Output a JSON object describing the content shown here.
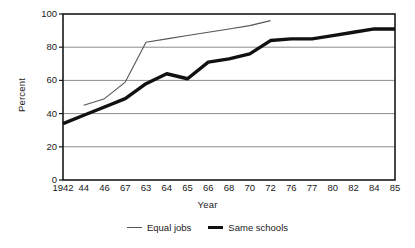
{
  "chart_data": {
    "type": "line",
    "title": "",
    "xlabel": "Year",
    "ylabel": "Percent",
    "ylim": [
      0,
      100
    ],
    "yticks": [
      0,
      20,
      40,
      60,
      80,
      100
    ],
    "grid": "horizontal",
    "legend_position": "bottom",
    "categories": [
      "1942",
      "44",
      "46",
      "67",
      "63",
      "64",
      "65",
      "66",
      "68",
      "70",
      "72",
      "76",
      "77",
      "80",
      "82",
      "84",
      "85"
    ],
    "series": [
      {
        "name": "Equal jobs",
        "style": "thin",
        "color": "#555555",
        "values": [
          null,
          45,
          49,
          59,
          83,
          85,
          87,
          89,
          91,
          93,
          96,
          null,
          null,
          null,
          null,
          null,
          null
        ]
      },
      {
        "name": "Same schools",
        "style": "thick",
        "color": "#111111",
        "values": [
          34,
          39,
          44,
          49,
          58,
          64,
          61,
          71,
          73,
          76,
          84,
          85,
          85,
          87,
          89,
          91,
          91
        ]
      }
    ]
  },
  "axis": {
    "y_title": "Percent",
    "x_title": "Year",
    "y_tick_labels": [
      "100",
      "80",
      "60",
      "40",
      "20",
      "0"
    ],
    "x_tick_labels": [
      "1942",
      "44",
      "46",
      "67",
      "63",
      "64",
      "65",
      "66",
      "68",
      "70",
      "72",
      "76",
      "77",
      "80",
      "82",
      "84",
      "85"
    ]
  },
  "legend": {
    "items": [
      {
        "label": "Equal jobs"
      },
      {
        "label": "Same schools"
      }
    ]
  },
  "colors": {
    "thin_line": "#555555",
    "thick_line": "#111111",
    "gridline": "#8c8c8c",
    "frame": "#1a1a1a",
    "background": "#ffffff"
  }
}
